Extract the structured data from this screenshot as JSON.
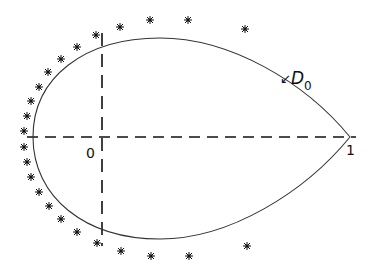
{
  "diagram": {
    "type": "teardrop-domain-with-points",
    "colors": {
      "ink": "#111111",
      "curve": "#333333",
      "background": "#ffffff"
    },
    "labels": {
      "origin": "0",
      "one": "1",
      "domain": "D",
      "domain_subscript": "0",
      "domain_arrow": "↙"
    },
    "axes": {
      "horizontal": {
        "x1": 27,
        "x2": 356,
        "y": 137,
        "style": "dashed"
      },
      "vertical": {
        "x": 102,
        "y1": 33,
        "y2": 246,
        "style": "dashed"
      }
    },
    "curve": {
      "name": "D0 boundary",
      "shape": "teardrop",
      "tip": [
        350,
        137
      ],
      "leftmost": [
        33,
        137
      ],
      "top": [
        160,
        38
      ],
      "bottom": [
        160,
        239
      ]
    },
    "points": [
      [
        96,
        35
      ],
      [
        120,
        27
      ],
      [
        150,
        20
      ],
      [
        188,
        20
      ],
      [
        245,
        29
      ],
      [
        77,
        47
      ],
      [
        61,
        59
      ],
      [
        48,
        72
      ],
      [
        39,
        87
      ],
      [
        31,
        101
      ],
      [
        27,
        116
      ],
      [
        24,
        131
      ],
      [
        24,
        147
      ],
      [
        27,
        162
      ],
      [
        31,
        177
      ],
      [
        39,
        192
      ],
      [
        49,
        206
      ],
      [
        61,
        219
      ],
      [
        77,
        232
      ],
      [
        97,
        243
      ],
      [
        121,
        251
      ],
      [
        151,
        256
      ],
      [
        189,
        256
      ],
      [
        247,
        246
      ]
    ]
  }
}
